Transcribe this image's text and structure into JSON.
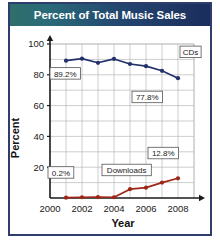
{
  "title": "Percent of Total Music Sales",
  "colors": {
    "cds_line": "#23316b",
    "downloads_line": "#9e2617",
    "title_gradient_start": "#2f6e6a",
    "title_gradient_end": "#1b2d5c",
    "frame_border": "#2e3d6b",
    "gridline": "#b9b9b9",
    "plot_background": "#ffffff"
  },
  "chart_data": {
    "type": "line",
    "title": "Percent of Total Music Sales",
    "xlabel": "Year",
    "ylabel": "Percent",
    "xlim": [
      2000,
      2009
    ],
    "ylim": [
      0,
      100
    ],
    "xticks": [
      "2000",
      "2002",
      "2004",
      "2006",
      "2008"
    ],
    "xtick_values": [
      2000,
      2002,
      2004,
      2006,
      2008
    ],
    "yticks": [
      "20",
      "40",
      "60",
      "80",
      "100"
    ],
    "ytick_values": [
      20,
      40,
      60,
      80,
      100
    ],
    "grid": true,
    "legend": "inline-labels",
    "x": [
      2001,
      2002,
      2003,
      2004,
      2005,
      2006,
      2007,
      2008
    ],
    "series": [
      {
        "name": "CDs",
        "color": "#23316b",
        "values": [
          89.2,
          90.5,
          87.8,
          90.3,
          87.0,
          85.6,
          82.6,
          77.8
        ]
      },
      {
        "name": "Downloads",
        "color": "#9e2617",
        "values": [
          0.2,
          0.5,
          0.6,
          0.5,
          5.7,
          6.7,
          10.0,
          12.8
        ]
      }
    ],
    "annotations": [
      {
        "text": "89.2%",
        "series": "CDs",
        "x": 2001,
        "y": 89.2
      },
      {
        "text": "77.8%",
        "series": "CDs",
        "x": 2008,
        "y": 77.8
      },
      {
        "text": "CDs",
        "series": "CDs",
        "x": 2008,
        "y": 85.0
      },
      {
        "text": "0.2%",
        "series": "Downloads",
        "x": 2001,
        "y": 0.2
      },
      {
        "text": "Downloads",
        "series": "Downloads",
        "x": 2005,
        "y": 5.7
      },
      {
        "text": "12.8%",
        "series": "Downloads",
        "x": 2008,
        "y": 12.8
      }
    ]
  }
}
